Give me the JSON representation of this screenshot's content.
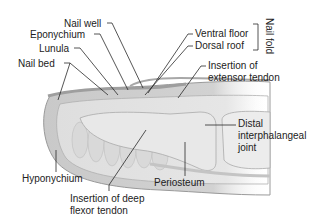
{
  "diagram": {
    "labels": {
      "nail_well": "Nail well",
      "eponychium": "Eponychium",
      "lunula": "Lunula",
      "nail_bed": "Nail bed",
      "ventral_floor": "Ventral floor",
      "dorsal_roof": "Dorsal roof",
      "nail_fold": "Nail fold",
      "insertion_extensor_1": "Insertion of",
      "insertion_extensor_2": "extensor tendon",
      "distal_ip_1": "Distal",
      "distal_ip_2": "interphalangeal",
      "distal_ip_3": "joint",
      "hyponychium": "Hyponychium",
      "periosteum": "Periosteum",
      "insertion_flexor_1": "Insertion of deep",
      "insertion_flexor_2": "flexor tendon"
    },
    "colors": {
      "background": "#ffffff",
      "skin_outer": "#b9b9b9",
      "tissue": "#d6d6d6",
      "bone": "#e4e4e4",
      "leader_line": "#2a2a2a",
      "text": "#222222"
    }
  }
}
